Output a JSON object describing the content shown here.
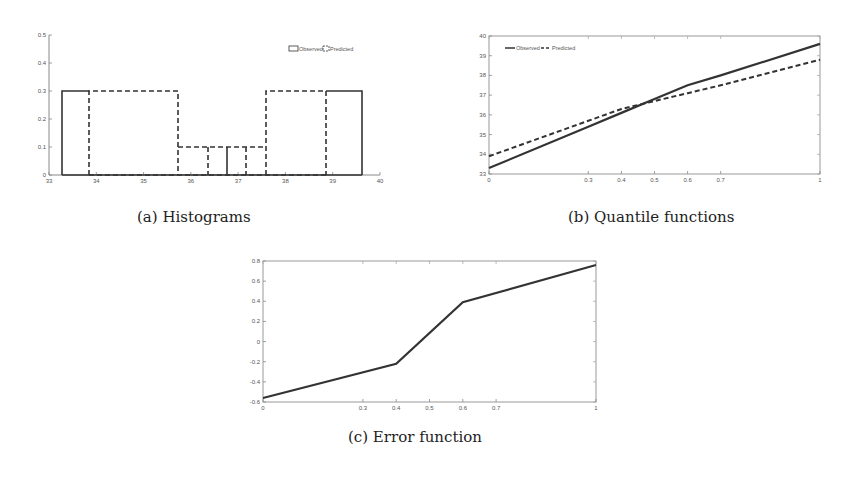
{
  "captions": {
    "a": "(a)  Histograms",
    "b": "(b)  Quantile functions",
    "c": "(c)  Error function"
  },
  "chart_data": [
    {
      "id": "a",
      "type": "bar",
      "title": "Histograms",
      "xlabel": "",
      "ylabel": "",
      "xlim": [
        33,
        40
      ],
      "ylim": [
        0,
        0.5
      ],
      "xticks": [
        33,
        34,
        35,
        36,
        37,
        38,
        39,
        40
      ],
      "yticks": [
        0,
        0.1,
        0.2,
        0.3,
        0.4,
        0.5
      ],
      "legend": {
        "position": "top-right",
        "entries": [
          "Observed",
          "Predicted"
        ]
      },
      "grid": false,
      "series": [
        {
          "name": "Observed",
          "style": "solid",
          "bins": [
            {
              "x0": 33.27,
              "x1": 36.77,
              "height": 0.3,
              "note": "left wide bin shown only to 0.3 at 33.27-33.85 region"
            },
            {
              "x0": 35.73,
              "x1": 36.77,
              "height": 0.1
            },
            {
              "x0": 36.77,
              "x1": 37.58,
              "height": 0.1
            },
            {
              "x0": 37.58,
              "x1": 39.64,
              "height": 0.3
            }
          ],
          "edges": [
            33.27,
            36.77,
            39.64
          ]
        },
        {
          "name": "Predicted",
          "style": "dashed",
          "bins": [
            {
              "x0": 33.85,
              "x1": 35.73,
              "height": 0.3
            },
            {
              "x0": 35.73,
              "x1": 36.34,
              "height": 0.1
            },
            {
              "x0": 36.34,
              "x1": 37.17,
              "height": 0.1
            },
            {
              "x0": 37.17,
              "x1": 37.58,
              "height": 0.1
            },
            {
              "x0": 37.58,
              "x1": 38.85,
              "height": 0.3
            }
          ],
          "edges": [
            33.85,
            35.73,
            36.34,
            37.17,
            37.58,
            38.85
          ]
        }
      ]
    },
    {
      "id": "b",
      "type": "line",
      "title": "Quantile functions",
      "xlabel": "",
      "ylabel": "",
      "xlim": [
        0,
        1
      ],
      "ylim": [
        33,
        40
      ],
      "xticks": [
        0,
        0.3,
        0.4,
        0.5,
        0.6,
        0.7,
        1
      ],
      "yticks": [
        33,
        34,
        35,
        36,
        37,
        38,
        39,
        40
      ],
      "legend": {
        "position": "top-left",
        "entries": [
          "Observed",
          "Predicted"
        ]
      },
      "grid": false,
      "x": [
        0,
        0.3,
        0.4,
        0.5,
        0.6,
        0.7,
        1
      ],
      "series": [
        {
          "name": "Observed",
          "style": "solid",
          "values": [
            33.3,
            35.4,
            36.1,
            36.8,
            37.5,
            38.0,
            39.6
          ]
        },
        {
          "name": "Predicted",
          "style": "dashed",
          "values": [
            33.9,
            35.7,
            36.3,
            36.7,
            37.1,
            37.5,
            38.8
          ]
        }
      ]
    },
    {
      "id": "c",
      "type": "line",
      "title": "Error function",
      "xlabel": "",
      "ylabel": "",
      "xlim": [
        0,
        1
      ],
      "ylim": [
        -0.6,
        0.8
      ],
      "xticks": [
        0,
        0.3,
        0.4,
        0.5,
        0.6,
        0.7,
        1
      ],
      "yticks": [
        -0.6,
        -0.4,
        -0.2,
        0,
        0.2,
        0.4,
        0.6,
        0.8
      ],
      "grid": false,
      "x": [
        0,
        0.4,
        0.6,
        1
      ],
      "series": [
        {
          "name": "Error",
          "style": "solid",
          "values": [
            -0.56,
            -0.22,
            0.39,
            0.76
          ]
        }
      ]
    }
  ],
  "labels": {
    "a_xticks": [
      "33",
      "34",
      "35",
      "36",
      "37",
      "38",
      "39",
      "40"
    ],
    "a_yticks": [
      "0",
      "0.1",
      "0.2",
      "0.3",
      "0.4",
      "0.5"
    ],
    "b_xticks": [
      "0",
      "0.3",
      "0.4",
      "0.5",
      "0.6",
      "0.7",
      "1"
    ],
    "b_yticks": [
      "33",
      "34",
      "35",
      "36",
      "37",
      "38",
      "39",
      "40"
    ],
    "c_xticks": [
      "0",
      "0.3",
      "0.4",
      "0.5",
      "0.6",
      "0.7",
      "1"
    ],
    "c_yticks": [
      "-0.6",
      "-0.4",
      "-0.2",
      "0",
      "0.2",
      "0.4",
      "0.6",
      "0.8"
    ],
    "legend_observed": "Observed",
    "legend_predicted": "Predicted"
  }
}
